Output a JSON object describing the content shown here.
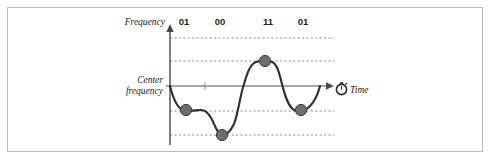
{
  "figure": {
    "title": "",
    "y_axis_label": "Frequency",
    "x_axis_label": "Time",
    "x_axis_icon": "stopwatch-icon",
    "center_line_label_line1": "Center",
    "center_line_label_line2": "frequency",
    "bit_labels": [
      "01",
      "00",
      "11",
      "01"
    ],
    "colors": {
      "curve": "#2e2e2e",
      "dot": "#6e6e6e",
      "dot_outline": "#3a3a3a",
      "axis": "#4a4a4a",
      "center_line": "#8a8a8a",
      "dashed_line": "#8f8f8f",
      "frame_border": "#b9b9b9",
      "background": "#ffffff",
      "text": "#222222"
    }
  },
  "chart_data": {
    "type": "line",
    "title": "",
    "xlabel": "Time",
    "ylabel": "Frequency",
    "grid": true,
    "legend_position": "none",
    "symbols": [
      {
        "bits": "01",
        "label_x": 184,
        "level_index": 2,
        "level_name": "low",
        "marker_x": 186,
        "marker_y": 110
      },
      {
        "bits": "00",
        "label_x": 220,
        "level_index": 3,
        "level_name": "lowest",
        "marker_x": 222,
        "marker_y": 135
      },
      {
        "bits": "11",
        "label_x": 268,
        "level_index": 1,
        "level_name": "high",
        "marker_x": 265,
        "marker_y": 61
      },
      {
        "bits": "01",
        "label_x": 303,
        "level_index": 2,
        "level_name": "low",
        "marker_x": 301,
        "marker_y": 110
      }
    ],
    "frequency_levels": [
      {
        "name": "highest",
        "y": 38,
        "dashed": true
      },
      {
        "name": "high",
        "y": 61,
        "dashed": true
      },
      {
        "name": "center",
        "y": 86,
        "dashed": false
      },
      {
        "name": "low",
        "y": 111,
        "dashed": true
      },
      {
        "name": "lowest",
        "y": 135,
        "dashed": true
      }
    ],
    "axis_ranges": {
      "x": [
        169,
        334
      ],
      "y": [
        30,
        145
      ]
    },
    "markers": [
      {
        "x": 186,
        "y": 110
      },
      {
        "x": 222,
        "y": 135
      },
      {
        "x": 265,
        "y": 61
      },
      {
        "x": 301,
        "y": 110
      }
    ],
    "curve_path": "M 170,86 C 173,98 177,108 183,110 C 189,112 196,110 201,110 C 206,110 210,114 214,124 C 218,133 220,135 223,135 C 227,135 230,132 234,124 C 238,114 240,96 244,84 C 247,74 250,64 256,62 C 261,60 267,60 272,62 C 277,64 279,72 282,84 C 285,96 288,106 294,110 C 299,113 305,111 310,106 C 315,101 318,94 320,86"
  }
}
